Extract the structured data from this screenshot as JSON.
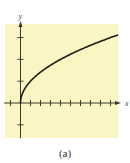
{
  "caption": "(a)",
  "colors": {
    "background": "#FBF5C4",
    "axis": "#3a3a2a",
    "curve": "#1e1e14"
  },
  "chart_data": {
    "type": "line",
    "title": "",
    "function": "y = sqrt(x)",
    "xlabel": "x",
    "ylabel": "y",
    "xlim": [
      -1.5,
      9.8
    ],
    "ylim": [
      -1.3,
      3.5
    ],
    "x_ticks": [
      -1,
      1,
      2,
      3,
      4,
      5,
      6,
      7,
      8,
      9
    ],
    "y_ticks": [
      -1,
      1,
      2,
      3
    ],
    "tick_labels_shown": false,
    "grid": false,
    "legend": "none",
    "series": [
      {
        "name": "y = sqrt(x)",
        "x": [
          0,
          0.25,
          0.5,
          1,
          2,
          3,
          4,
          5,
          6,
          7,
          8,
          9,
          9.7
        ],
        "y": [
          0,
          0.5,
          0.71,
          1,
          1.41,
          1.73,
          2,
          2.24,
          2.45,
          2.65,
          2.83,
          3,
          3.11
        ]
      }
    ]
  }
}
